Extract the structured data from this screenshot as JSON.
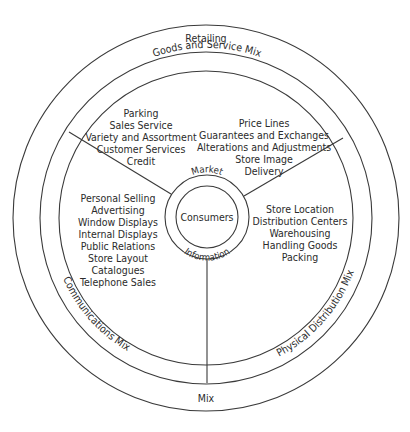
{
  "diagram": {
    "outer_ring_label_top": "Retailing",
    "outer_ring_label_bottom": "Mix",
    "segments": {
      "goods_and_service": {
        "ring_label": "Goods and Service Mix",
        "items_left": [
          "Parking",
          "Sales Service",
          "Variety and Assortment",
          "Customer Services",
          "Credit"
        ],
        "items_right": [
          "Price Lines",
          "Guarantees and Exchanges",
          "Alterations and Adjustments",
          "Store Image",
          "Delivery"
        ]
      },
      "communications": {
        "ring_label": "Communications Mix",
        "items": [
          "Personal Selling",
          "Advertising",
          "Window Displays",
          "Internal Displays",
          "Public Relations",
          "Store Layout",
          "Catalogues",
          "Telephone Sales"
        ]
      },
      "physical_distribution": {
        "ring_label": "Physical Distribution Mix",
        "items": [
          "Store Location",
          "Distribution Centers",
          "Warehousing",
          "Handling Goods",
          "Packing"
        ]
      }
    },
    "core": {
      "market_label": "Market",
      "information_label": "Information",
      "center_label": "Consumers"
    },
    "colors": {
      "stroke": "#3a3a3a",
      "text": "#2b2b2b",
      "background": "#ffffff"
    }
  }
}
